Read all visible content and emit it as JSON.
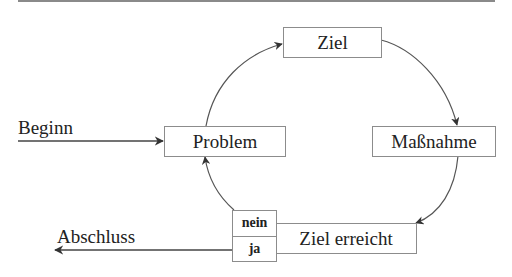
{
  "diagram": {
    "type": "cycle",
    "nodes": {
      "goal": "Ziel",
      "measure": "Maßnahme",
      "goal_reached": "Ziel erreicht",
      "problem": "Problem"
    },
    "decision": {
      "no": "nein",
      "yes": "ja"
    },
    "entry_label": "Beginn",
    "exit_label": "Abschluss",
    "edges": [
      {
        "from": "Beginn",
        "to": "Problem"
      },
      {
        "from": "Problem",
        "to": "Ziel"
      },
      {
        "from": "Ziel",
        "to": "Maßnahme"
      },
      {
        "from": "Maßnahme",
        "to": "Ziel erreicht"
      },
      {
        "from": "nein",
        "to": "Problem"
      },
      {
        "from": "ja",
        "to": "Abschluss"
      }
    ],
    "colors": {
      "line": "#444444",
      "box_border": "#8c8c8c",
      "rule": "#8a8a8a"
    }
  }
}
